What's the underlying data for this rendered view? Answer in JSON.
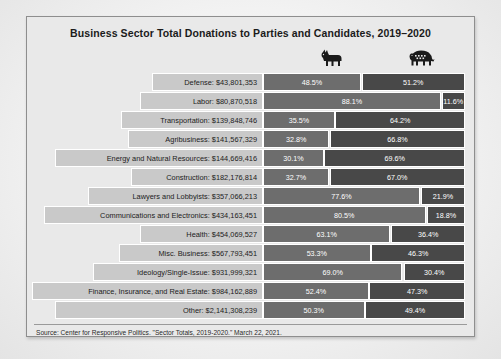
{
  "chart_data": {
    "type": "bar",
    "title": "Business Sector Total Donations to Parties and Candidates, 2019–2020",
    "subtype": "diverging-stacked-percentage",
    "xlabel": "",
    "ylabel": "",
    "xlim": [
      0,
      100
    ],
    "grid": false,
    "legend_position": "top",
    "legend": [
      {
        "name": "Democratic",
        "icon": "donkey-icon",
        "color": "#6d6d6d"
      },
      {
        "name": "Republican",
        "icon": "elephant-icon",
        "color": "#484848"
      }
    ],
    "categories": [
      "Defense",
      "Labor",
      "Transportation",
      "Agribusiness",
      "Energy and Natural Resources",
      "Construction",
      "Lawyers and Lobbyists",
      "Communications and Electronics",
      "Health",
      "Misc. Business",
      "Ideology/Single-Issue",
      "Finance, Insurance, and Real Estate",
      "Other"
    ],
    "amounts": [
      43801353,
      80870518,
      139848746,
      141567329,
      144669416,
      182176814,
      357066213,
      434163451,
      454069527,
      567793451,
      931999321,
      984162889,
      2141308239
    ],
    "series": [
      {
        "name": "Democratic",
        "values": [
          48.5,
          88.1,
          35.5,
          32.8,
          30.1,
          32.7,
          77.6,
          80.5,
          63.1,
          53.3,
          69.0,
          52.4,
          50.3
        ]
      },
      {
        "name": "Republican",
        "values": [
          51.2,
          11.6,
          64.2,
          66.8,
          69.6,
          67.0,
          21.9,
          18.8,
          36.4,
          46.3,
          30.4,
          47.3,
          49.4
        ]
      }
    ],
    "source": "Source: Center for Responsive Politics. \"Sector Totals, 2019-2020.\" March 22, 2021."
  },
  "rows": [
    {
      "label": "Defense: $43,801,353",
      "amount_label": "$43,801,353",
      "label_width_pct": 47.0,
      "dem": "48.5%",
      "rep": "51.2%",
      "dem_val": 48.5,
      "rep_val": 51.2
    },
    {
      "label": "Labor: $80,870,518",
      "amount_label": "$80,870,518",
      "label_width_pct": 52.0,
      "dem": "88.1%",
      "rep": "11.6%",
      "dem_val": 88.1,
      "rep_val": 11.6
    },
    {
      "label": "Transportation: $139,848,746",
      "amount_label": "$139,848,746",
      "label_width_pct": 60.0,
      "dem": "35.5%",
      "rep": "64.2%",
      "dem_val": 35.5,
      "rep_val": 64.2
    },
    {
      "label": "Agribusiness: $141,567,329",
      "amount_label": "$141,567,329",
      "label_width_pct": 57.0,
      "dem": "32.8%",
      "rep": "66.8%",
      "dem_val": 32.8,
      "rep_val": 66.8
    },
    {
      "label": "Energy and Natural Resources: $144,669,416",
      "amount_label": "$144,669,416",
      "label_width_pct": 88.0,
      "dem": "30.1%",
      "rep": "69.6%",
      "dem_val": 30.1,
      "rep_val": 69.6
    },
    {
      "label": "Construction: $182,176,814",
      "amount_label": "$182,176,814",
      "label_width_pct": 56.0,
      "dem": "32.7%",
      "rep": "67.0%",
      "dem_val": 32.7,
      "rep_val": 67.0
    },
    {
      "label": "Lawyers and Lobbyists: $357,066,213",
      "amount_label": "$357,066,213",
      "label_width_pct": 74.0,
      "dem": "77.6%",
      "rep": "21.9%",
      "dem_val": 77.6,
      "rep_val": 21.9
    },
    {
      "label": "Communications and Electronics: $434,163,451",
      "amount_label": "$434,163,451",
      "label_width_pct": 93.0,
      "dem": "80.5%",
      "rep": "18.8%",
      "dem_val": 80.5,
      "rep_val": 18.8
    },
    {
      "label": "Health: $454,069,527",
      "amount_label": "$454,069,527",
      "label_width_pct": 52.0,
      "dem": "63.1%",
      "rep": "36.4%",
      "dem_val": 63.1,
      "rep_val": 36.4
    },
    {
      "label": "Misc. Business: $567,793,451",
      "amount_label": "$567,793,451",
      "label_width_pct": 61.0,
      "dem": "53.3%",
      "rep": "46.3%",
      "dem_val": 53.3,
      "rep_val": 46.3
    },
    {
      "label": "Ideology/Single-Issue: $931,999,321",
      "amount_label": "$931,999,321",
      "label_width_pct": 72.0,
      "dem": "69.0%",
      "rep": "30.4%",
      "dem_val": 69.0,
      "rep_val": 30.4
    },
    {
      "label": "Finance, Insurance, and Real Estate: $984,162,889",
      "amount_label": "$984,162,889",
      "label_width_pct": 98.0,
      "dem": "52.4%",
      "rep": "47.3%",
      "dem_val": 52.4,
      "rep_val": 47.3
    },
    {
      "label": "Other: $2,141,308,239",
      "amount_label": "$2,141,308,239",
      "label_width_pct": 88.0,
      "dem": "50.3%",
      "rep": "49.4%",
      "dem_val": 50.3,
      "rep_val": 49.4
    }
  ],
  "header": {
    "dem_icon": "donkey-icon",
    "rep_icon": "elephant-icon"
  },
  "colors": {
    "dem_segment": "#6d6d6d",
    "rep_segment": "#484848",
    "label_bar": "#c9c9c9",
    "frame_bg": "#e9e9e9",
    "frame_border": "#8e8e8e"
  }
}
